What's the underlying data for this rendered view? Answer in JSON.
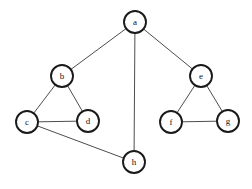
{
  "graph": {
    "title": "undirected-graph",
    "background_color": "#ffffff",
    "node_fill_color": "#ffffff",
    "node_stroke_color": "#1a1a1a",
    "edge_color": "#4d4d4d",
    "label_color": "#111111",
    "node_radius": 11,
    "nodes": [
      {
        "id": "a",
        "label": "a",
        "x": 135,
        "y": 22
      },
      {
        "id": "b",
        "label": "b",
        "x": 62,
        "y": 76
      },
      {
        "id": "c",
        "label": "c",
        "x": 27,
        "y": 122
      },
      {
        "id": "d",
        "label": "d",
        "x": 88,
        "y": 121
      },
      {
        "id": "e",
        "label": "e",
        "x": 201,
        "y": 76
      },
      {
        "id": "f",
        "label": "f",
        "x": 171,
        "y": 122
      },
      {
        "id": "g",
        "label": "g",
        "x": 228,
        "y": 121
      },
      {
        "id": "h",
        "label": "h",
        "x": 134,
        "y": 162
      }
    ],
    "edges": [
      {
        "id": "a-b",
        "source": "a",
        "target": "b"
      },
      {
        "id": "a-e",
        "source": "a",
        "target": "e"
      },
      {
        "id": "a-h",
        "source": "a",
        "target": "h"
      },
      {
        "id": "b-c",
        "source": "b",
        "target": "c"
      },
      {
        "id": "b-d",
        "source": "b",
        "target": "d"
      },
      {
        "id": "c-d",
        "source": "c",
        "target": "d"
      },
      {
        "id": "c-h",
        "source": "c",
        "target": "h"
      },
      {
        "id": "e-f",
        "source": "e",
        "target": "f"
      },
      {
        "id": "e-g",
        "source": "e",
        "target": "g"
      },
      {
        "id": "f-g",
        "source": "f",
        "target": "g"
      }
    ]
  }
}
